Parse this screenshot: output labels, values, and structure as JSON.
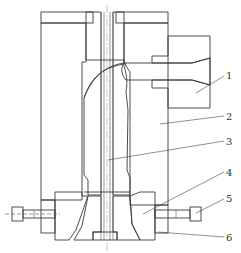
{
  "diagram": {
    "type": "engineering-cross-section",
    "colors": {
      "line": "#3a3a3a",
      "hatch": "#7a7a7a",
      "background": "#ffffff"
    },
    "callouts": [
      {
        "id": "1",
        "label": "1",
        "part": "side feed block"
      },
      {
        "id": "2",
        "label": "2",
        "part": "die body"
      },
      {
        "id": "3",
        "label": "3",
        "part": "mandrel"
      },
      {
        "id": "4",
        "label": "4",
        "part": "die ring"
      },
      {
        "id": "5",
        "label": "5",
        "part": "adjusting bolt"
      },
      {
        "id": "6",
        "label": "6",
        "part": "die insert"
      }
    ]
  }
}
